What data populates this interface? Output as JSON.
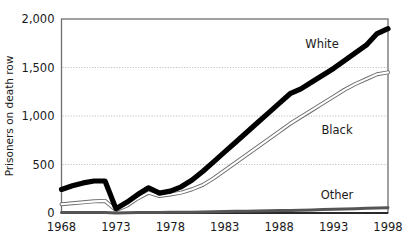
{
  "chart_data": {
    "type": "line",
    "title": "",
    "xlabel": "",
    "ylabel": "Prisoners on death row",
    "xlim": [
      1968,
      1998
    ],
    "ylim": [
      0,
      2000
    ],
    "grid": "horizontal-dotted",
    "legend_position": "inline-annotations",
    "x_tick_labels": [
      "1968",
      "1973",
      "1978",
      "1983",
      "1988",
      "1993",
      "1998"
    ],
    "x_ticks": [
      1968,
      1973,
      1978,
      1983,
      1988,
      1993,
      1998
    ],
    "y_tick_labels": [
      "0",
      "500",
      "1,000",
      "1,500",
      "2,000"
    ],
    "y_ticks": [
      0,
      500,
      1000,
      1500,
      2000
    ],
    "x": [
      1968,
      1969,
      1970,
      1971,
      1972,
      1973,
      1974,
      1975,
      1976,
      1977,
      1978,
      1979,
      1980,
      1981,
      1982,
      1983,
      1984,
      1985,
      1986,
      1987,
      1988,
      1989,
      1990,
      1991,
      1992,
      1993,
      1994,
      1995,
      1996,
      1997,
      1998
    ],
    "series": [
      {
        "name": "White",
        "label": "White",
        "color": "#000000",
        "style": "thick-black",
        "values": [
          243,
          280,
          310,
          330,
          330,
          45,
          110,
          190,
          260,
          205,
          225,
          270,
          340,
          430,
          530,
          630,
          730,
          830,
          930,
          1030,
          1130,
          1230,
          1280,
          1350,
          1420,
          1490,
          1570,
          1650,
          1730,
          1850,
          1900
        ]
      },
      {
        "name": "Black",
        "label": "Black",
        "color": "#9a9a9a",
        "style": "thin-outlined-gray",
        "values": [
          90,
          100,
          110,
          120,
          125,
          30,
          75,
          150,
          210,
          175,
          190,
          210,
          245,
          290,
          360,
          440,
          520,
          600,
          680,
          760,
          840,
          920,
          990,
          1060,
          1130,
          1200,
          1270,
          1330,
          1380,
          1430,
          1450
        ]
      },
      {
        "name": "Other",
        "label": "Other",
        "color": "#555555",
        "style": "flat-thin-dark",
        "values": [
          5,
          5,
          6,
          6,
          6,
          1,
          2,
          4,
          6,
          6,
          7,
          8,
          9,
          11,
          13,
          15,
          17,
          19,
          21,
          23,
          25,
          27,
          29,
          32,
          35,
          38,
          42,
          45,
          48,
          52,
          55
        ]
      }
    ],
    "annotations": [
      {
        "text": "White",
        "x_pixel": 322,
        "y_pixel": 48
      },
      {
        "text": "Black",
        "x_pixel": 337,
        "y_pixel": 134
      },
      {
        "text": "Other",
        "x_pixel": 337,
        "y_pixel": 199
      }
    ]
  }
}
